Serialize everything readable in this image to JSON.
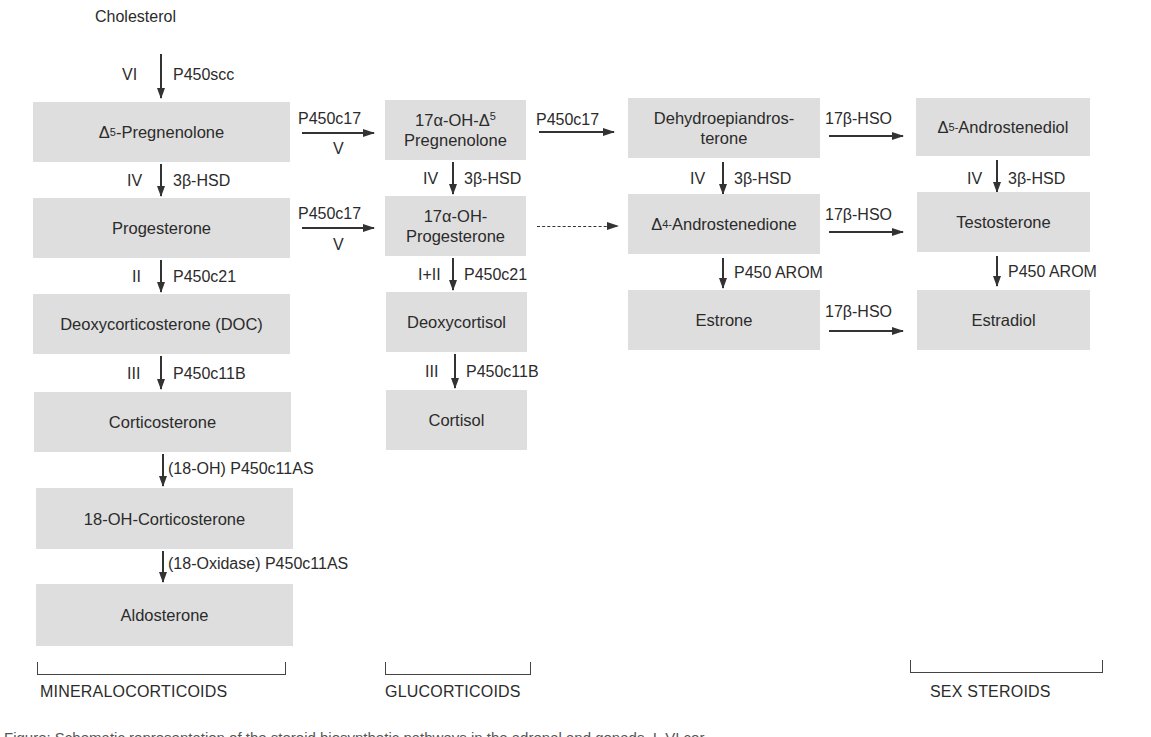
{
  "title": "Steroid biosynthetic pathways in the adrenal and gonads",
  "start": {
    "label": "Cholesterol",
    "step": "VI",
    "enzyme": "P450scc"
  },
  "columns": {
    "mineralocorticoids": {
      "compounds": [
        {
          "pre": "Δ",
          "sup": "5",
          "post": "-Pregnenolone"
        },
        {
          "label": "Progesterone"
        },
        {
          "label": "Deoxycorticosterone (DOC)"
        },
        {
          "label": "Corticosterone"
        },
        {
          "label": "18-OH-Corticosterone"
        },
        {
          "label": "Aldosterone"
        }
      ],
      "steps": [
        {
          "roman": "IV",
          "enzyme": "3β-HSD"
        },
        {
          "roman": "II",
          "enzyme": "P450c21"
        },
        {
          "roman": "III",
          "enzyme": "P450c11B"
        },
        {
          "roman": "",
          "enzyme": "(18-OH) P450c11AS"
        },
        {
          "roman": "",
          "enzyme": "(18-Oxidase) P450c11AS"
        }
      ]
    },
    "glucocorticoids": {
      "compounds": [
        {
          "line1_pre": "17α-OH-Δ",
          "line1_sup": "5",
          "line2": "Pregnenolone"
        },
        {
          "line1": "17α-OH-",
          "line2": "Progesterone"
        },
        {
          "label": "Deoxycortisol"
        },
        {
          "label": "Cortisol"
        }
      ],
      "steps": [
        {
          "roman": "IV",
          "enzyme": "3β-HSD"
        },
        {
          "roman": "I+II",
          "enzyme": "P450c21"
        },
        {
          "roman": "III",
          "enzyme": "P450c11B"
        }
      ]
    },
    "androgens": {
      "compounds": [
        {
          "line1": "Dehydroepiandros-",
          "line2": "terone"
        },
        {
          "pre": "Δ",
          "sup": "4-",
          "post": "Androstenedione"
        },
        {
          "label": "Estrone"
        }
      ],
      "steps": [
        {
          "roman": "IV",
          "enzyme": "3β-HSD"
        },
        {
          "roman": "",
          "enzyme": "P450 AROM"
        }
      ]
    },
    "sex_steroids": {
      "compounds": [
        {
          "pre": "Δ",
          "sup": "5-",
          "post": "Androstenediol"
        },
        {
          "label": "Testosterone"
        },
        {
          "label": "Estradiol"
        }
      ],
      "steps": [
        {
          "roman": "IV",
          "enzyme": "3β-HSD"
        },
        {
          "roman": "",
          "enzyme": "P450 AROM"
        }
      ]
    }
  },
  "horizontal": {
    "c1_to_c2_row1": {
      "enzyme": "P450c17",
      "roman": "V"
    },
    "c1_to_c2_row2": {
      "enzyme": "P450c17",
      "roman": "V"
    },
    "c2_to_c3_row1": {
      "enzyme": "P450c17"
    },
    "c3_to_c4_row1": {
      "enzyme": "17β-HSO"
    },
    "c3_to_c4_row2": {
      "enzyme": "17β-HSO"
    },
    "c3_to_c4_row3": {
      "enzyme": "17β-HSO"
    }
  },
  "groups": {
    "mineralocorticoids": "MINERALOCORTICOIDS",
    "glucocorticoids": "GLUCORTICOIDS",
    "sex_steroids": "SEX STEROIDS"
  },
  "caption": "Figure: Schematic representation of the steroid biosynthetic pathways in the adrenal and gonads. I–VI cor"
}
